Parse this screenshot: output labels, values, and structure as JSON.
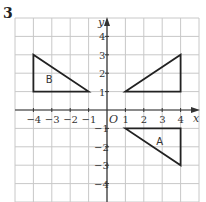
{
  "question_number": "3",
  "axes": {
    "x_label": "x",
    "y_label": "y",
    "origin_label": "O",
    "x_ticks": [
      "-4",
      "-3",
      "-2",
      "-1",
      "1",
      "2",
      "3",
      "4"
    ],
    "y_ticks": [
      "4",
      "3",
      "2",
      "1",
      "-1",
      "-2",
      "-3",
      "-4"
    ]
  },
  "shapes": [
    {
      "label": "B",
      "vertices": [
        [
          -4,
          3
        ],
        [
          -4,
          1
        ],
        [
          -1,
          1
        ]
      ]
    },
    {
      "label": "",
      "vertices": [
        [
          1,
          1
        ],
        [
          4,
          3
        ],
        [
          4,
          1
        ]
      ]
    },
    {
      "label": "A",
      "vertices": [
        [
          1,
          -1
        ],
        [
          4,
          -1
        ],
        [
          4,
          -3
        ]
      ]
    }
  ],
  "colors": {
    "grid": "#c8c8c8",
    "axis": "#333333",
    "shape": "#222222"
  }
}
